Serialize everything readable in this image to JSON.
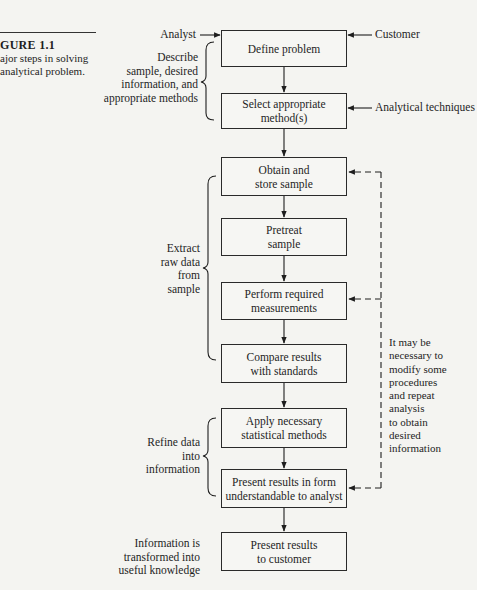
{
  "figure": {
    "title": "GURE 1.1",
    "caption": "ajor steps in solving\n analytical problem."
  },
  "flow_steps": [
    {
      "id": "define",
      "label": "Define problem"
    },
    {
      "id": "select",
      "label": "Select appropriate\nmethod(s)"
    },
    {
      "id": "obtain",
      "label": "Obtain and\nstore sample"
    },
    {
      "id": "pretreat",
      "label": "Pretreat\nsample"
    },
    {
      "id": "measure",
      "label": "Perform required\nmeasurements"
    },
    {
      "id": "compare",
      "label": "Compare results\nwith standards"
    },
    {
      "id": "statistics",
      "label": "Apply necessary\nstatistical methods"
    },
    {
      "id": "present_analyst",
      "label": "Present results in form\nunderstandable to analyst"
    },
    {
      "id": "present_customer",
      "label": "Present results\nto customer"
    }
  ],
  "inputs": {
    "analyst": "Analyst",
    "customer": "Customer",
    "techniques": "Analytical techniques"
  },
  "brace_labels": {
    "describe": "Describe\nsample, desired\ninformation, and\nappropriate methods",
    "extract": "Extract\nraw data\nfrom\nsample",
    "refine": "Refine data\ninto\ninformation",
    "transform": "Information is\ntransformed into\nuseful knowledge"
  },
  "feedback_note": "It may be\nnecessary to\nmodify some\nprocedures\nand repeat\nanalysis\nto obtain\ndesired\ninformation",
  "colors": {
    "ink": "#1e1e1e",
    "paper": "#f4f4f1"
  }
}
